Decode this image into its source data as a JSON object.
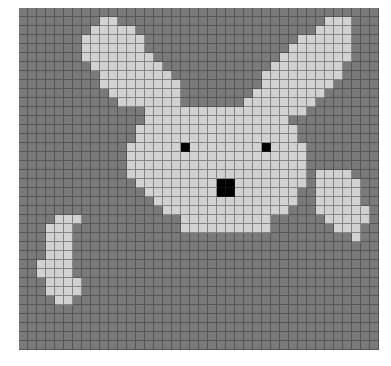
{
  "canvas": {
    "cols": 40,
    "rows": 38,
    "cell_size_px": 9,
    "palette": {
      "0": "#7a7a7a",
      "1": "#d2d2d2",
      "2": "#000000"
    },
    "subject": "pixel-art bunny",
    "pixels": [
      "0000000000000000000000000000000000000000",
      "0000000001100000000000000000000000111000",
      "0000000011111000000000000000000001111000",
      "0000000111111100000000000000000111111000",
      "0000000111111100000000000000001111111000",
      "0000000111111110000000000000011111111000",
      "0000000011111111000000000000111111110000",
      "0000000001111111100000000001111111110000",
      "0000000001111111110000000001111111100000",
      "0000000000111111110000000011111111000000",
      "0000000000011111110000000111111110000000",
      "0000000000000011111111111111111100000000",
      "0000000000000011111111111111110000000000",
      "0000000000000111111111111111111000000000",
      "0000000000000111111111111111111000000000",
      "0000000000001111112111111112111100000000",
      "0000000000001111111111111111111100000000",
      "0000000000001111111111111111111100000000",
      "0000000000001111111111111111111101111000",
      "0000000000000111111111221111111101111100",
      "0000000000000011111111221111111001111100",
      "0000000000000001111111111111111001111100",
      "0000000000000000111111111111110001111110",
      "0000111000000000001111111111000000111110",
      "0001110000000000001111111111000000011100",
      "0001110000000000000000000000000000000100",
      "0001110000000000000000000000000000000000",
      "0001110000000000000000000000000000000000",
      "0011110000000000000000000000000000000000",
      "0011110000000000000000000000000000000000",
      "0001111000000000000000000000000000000000",
      "0001111000000000000000000000000000000000",
      "0000110000000000000000000000000000000000",
      "0000000000000000000000000000000000000000",
      "0000000000000000000000000000000000000000",
      "0000000000000000000000000000000000000000",
      "0000000000000000000000000000000000000000",
      "0000000000000000000000000000000000000000"
    ]
  }
}
